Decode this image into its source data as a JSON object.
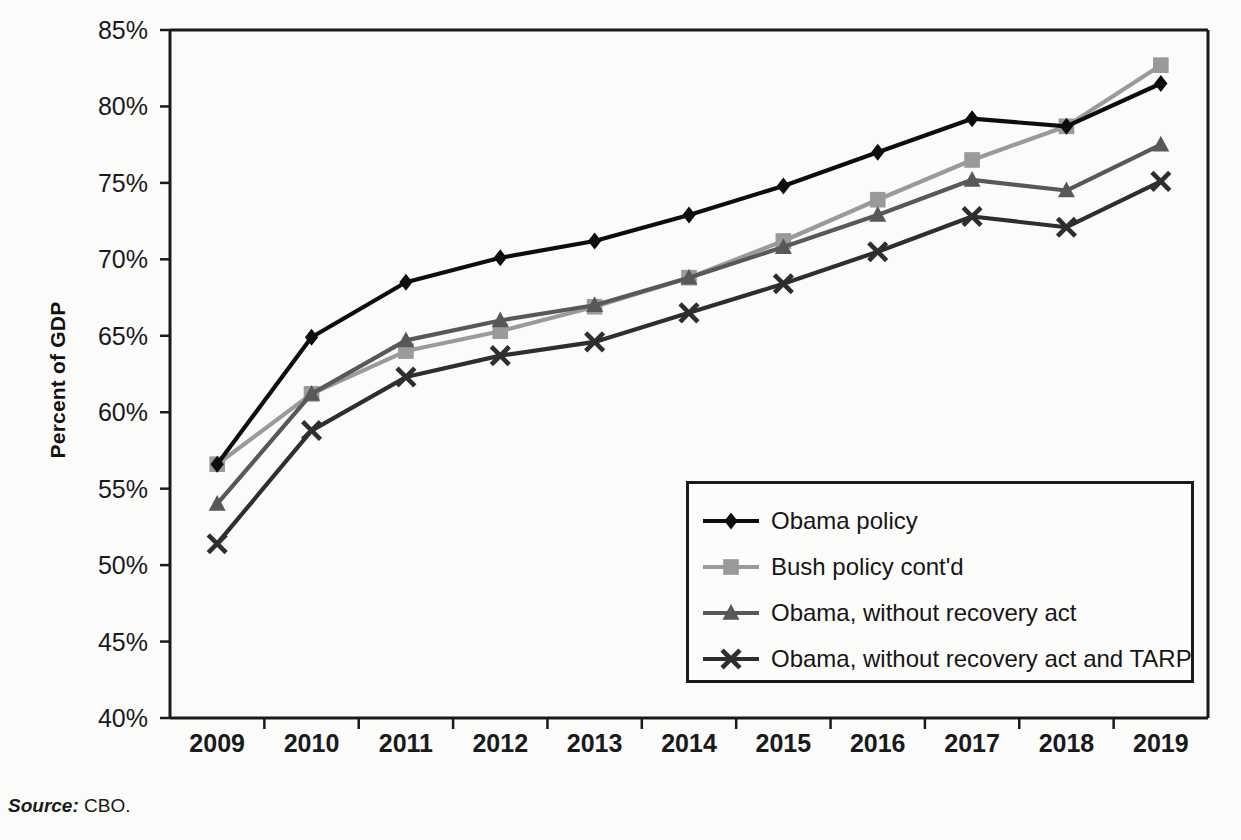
{
  "source_note": {
    "label": "Source:",
    "text": "CBO."
  },
  "chart_data": {
    "type": "line",
    "title": "",
    "subtitle": "",
    "xlabel": "",
    "ylabel": "Percent of GDP",
    "categories": [
      "2009",
      "2010",
      "2011",
      "2012",
      "2013",
      "2014",
      "2015",
      "2016",
      "2017",
      "2018",
      "2019"
    ],
    "x_tick_labels": [
      "2009",
      "2010",
      "2011",
      "2012",
      "2013",
      "2014",
      "2015",
      "2016",
      "2017",
      "2018",
      "2019"
    ],
    "y_tick_labels": [
      "40%",
      "45%",
      "50%",
      "55%",
      "60%",
      "65%",
      "70%",
      "75%",
      "80%",
      "85%"
    ],
    "y_tick_values": [
      40,
      45,
      50,
      55,
      60,
      65,
      70,
      75,
      80,
      85
    ],
    "ylim": [
      40,
      85
    ],
    "grid": false,
    "legend_position": "inside-lower-right",
    "series": [
      {
        "name": "Obama policy",
        "color": "#0d0d0d",
        "marker": "diamond",
        "values": [
          56.6,
          64.9,
          68.5,
          70.1,
          71.2,
          72.9,
          74.8,
          77.0,
          79.2,
          78.7,
          81.5
        ]
      },
      {
        "name": "Bush policy cont'd",
        "color": "#9a9a9a",
        "marker": "square",
        "values": [
          56.6,
          61.2,
          64.0,
          65.3,
          66.9,
          68.8,
          71.2,
          73.9,
          76.5,
          78.7,
          82.7
        ]
      },
      {
        "name": "Obama, without recovery act",
        "color": "#585858",
        "marker": "triangle",
        "values": [
          54.0,
          61.2,
          64.7,
          66.0,
          67.0,
          68.8,
          70.8,
          72.9,
          75.2,
          74.5,
          77.5
        ]
      },
      {
        "name": "Obama, without recovery act and TARP",
        "color": "#2e2e2e",
        "marker": "cross",
        "values": [
          51.4,
          58.8,
          62.3,
          63.7,
          64.6,
          66.5,
          68.4,
          70.5,
          72.8,
          72.1,
          75.1
        ]
      }
    ]
  },
  "legend": {
    "items": [
      {
        "label": "Obama policy"
      },
      {
        "label": "Bush policy cont'd"
      },
      {
        "label": "Obama, without recovery act"
      },
      {
        "label": "Obama, without recovery act and TARP"
      }
    ]
  },
  "plot_geometry": {
    "left": 170,
    "right": 1208,
    "top": 30,
    "bottom": 718
  }
}
